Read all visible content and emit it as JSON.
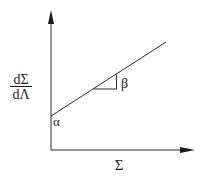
{
  "diagram": {
    "y_axis_label": {
      "numerator": "dΣ",
      "denominator": "dΛ"
    },
    "x_axis_label": "Σ",
    "intercept_label": "α",
    "slope_label": "β",
    "colors": {
      "stroke": "#2a2a2a",
      "background": "#ffffff"
    }
  }
}
